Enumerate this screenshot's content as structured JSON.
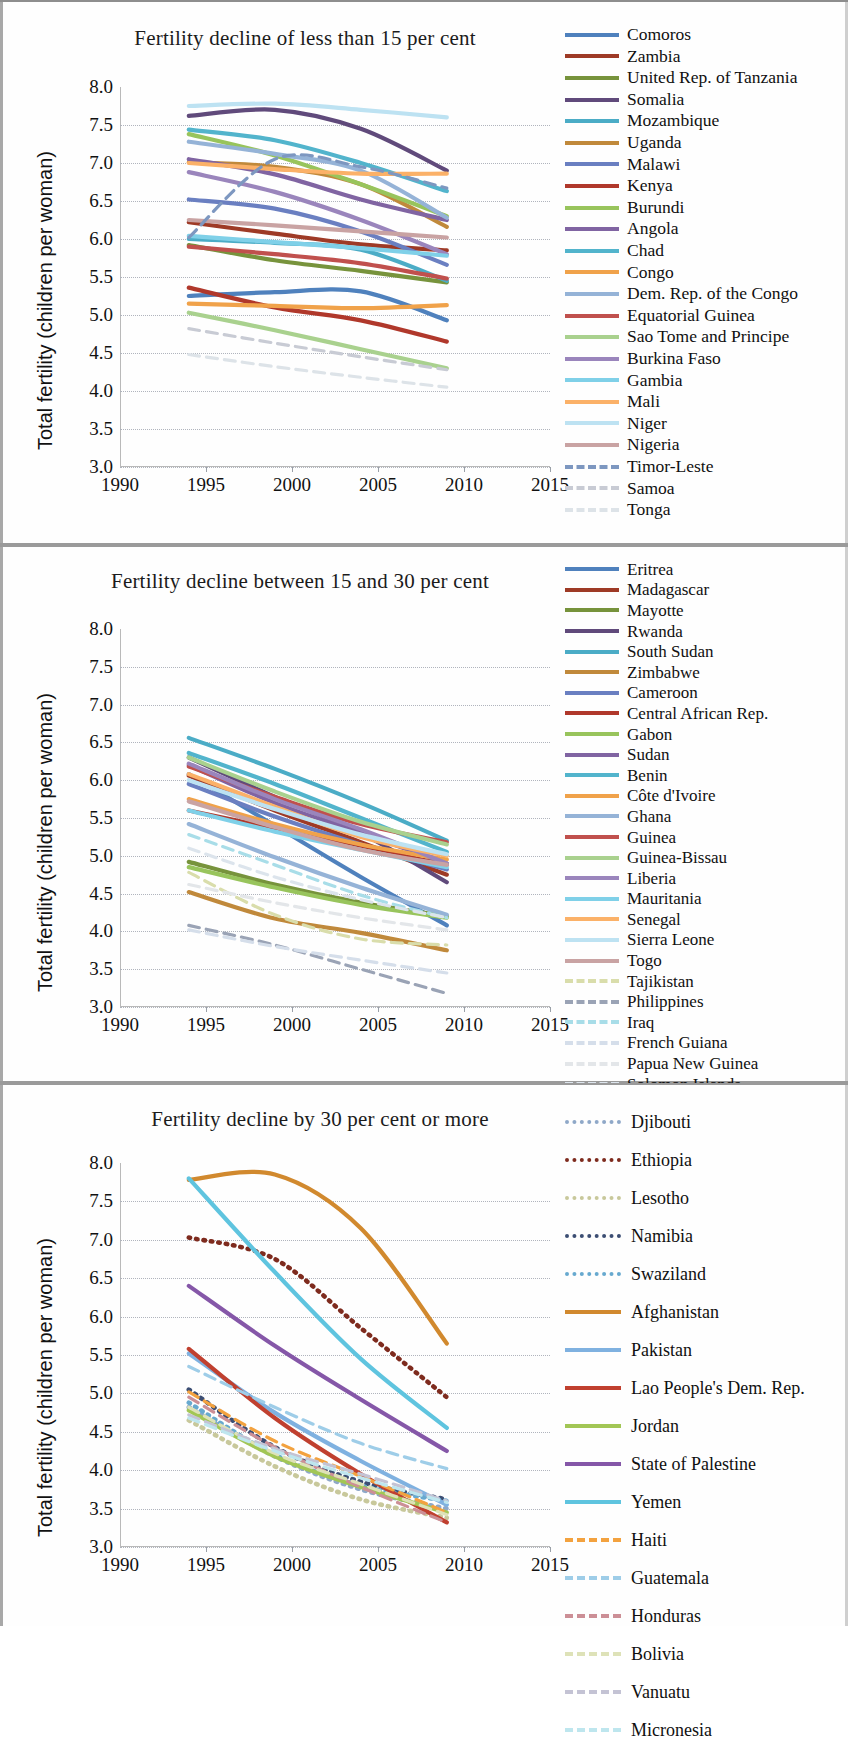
{
  "figure": {
    "ylabel": "Total fertility (children per woman)",
    "yticks": [
      "8.0",
      "7.5",
      "7.0",
      "6.5",
      "6.0",
      "5.5",
      "5.0",
      "4.5",
      "4.0",
      "3.5",
      "3.0"
    ],
    "xticks": [
      "1990",
      "1995",
      "2000",
      "2005",
      "2010",
      "2015"
    ]
  },
  "chart_data": [
    {
      "type": "line",
      "title": "Fertility decline of less than 15 per cent",
      "xlabel": "",
      "ylabel": "Total fertility (children per woman)",
      "xlim": [
        1990,
        2015
      ],
      "ylim": [
        3.0,
        8.0
      ],
      "x": [
        1994,
        1999,
        2004,
        2009
      ],
      "grid": true,
      "legend_position": "right",
      "series": [
        {
          "name": "Comoros",
          "color": "#4F81BD",
          "style": "solid",
          "values": [
            5.25,
            5.3,
            5.31,
            4.93
          ]
        },
        {
          "name": "Zambia",
          "color": "#9E3A26",
          "style": "solid",
          "values": [
            6.22,
            6.07,
            5.93,
            5.85
          ]
        },
        {
          "name": "United Rep. of Tanzania",
          "color": "#77933C",
          "style": "solid",
          "values": [
            5.92,
            5.72,
            5.58,
            5.43
          ]
        },
        {
          "name": "Somalia",
          "color": "#604A7B",
          "style": "solid",
          "values": [
            7.62,
            7.7,
            7.45,
            6.9
          ]
        },
        {
          "name": "Mozambique",
          "color": "#4BACC6",
          "style": "solid",
          "values": [
            6.0,
            5.95,
            5.86,
            5.45
          ]
        },
        {
          "name": "Uganda",
          "color": "#C0893B",
          "style": "solid",
          "values": [
            7.01,
            6.95,
            6.72,
            6.16
          ]
        },
        {
          "name": "Malawi",
          "color": "#6A7FC1",
          "style": "solid",
          "values": [
            6.52,
            6.4,
            6.1,
            5.66
          ]
        },
        {
          "name": "Kenya",
          "color": "#B0382B",
          "style": "solid",
          "values": [
            5.36,
            5.1,
            4.93,
            4.65
          ]
        },
        {
          "name": "Burundi",
          "color": "#98C45C",
          "style": "solid",
          "values": [
            7.38,
            7.1,
            6.72,
            6.3
          ]
        },
        {
          "name": "Angola",
          "color": "#8064A2",
          "style": "solid",
          "values": [
            7.05,
            6.85,
            6.52,
            6.25
          ]
        },
        {
          "name": "Chad",
          "color": "#52B4CC",
          "style": "solid",
          "values": [
            7.44,
            7.3,
            7.0,
            6.63
          ]
        },
        {
          "name": "Congo",
          "color": "#F0A24A",
          "style": "solid",
          "values": [
            5.15,
            5.12,
            5.09,
            5.13
          ]
        },
        {
          "name": "Dem. Rep. of the Congo",
          "color": "#95B3D7",
          "style": "solid",
          "values": [
            7.28,
            7.12,
            6.9,
            6.28
          ]
        },
        {
          "name": "Equatorial Guinea",
          "color": "#C0504D",
          "style": "solid",
          "values": [
            5.9,
            5.8,
            5.68,
            5.48
          ]
        },
        {
          "name": "Sao Tome and Principe",
          "color": "#A9D18E",
          "style": "solid",
          "values": [
            5.03,
            4.8,
            4.55,
            4.3
          ]
        },
        {
          "name": "Burkina Faso",
          "color": "#9A85BC",
          "style": "solid",
          "values": [
            6.88,
            6.62,
            6.25,
            5.8
          ]
        },
        {
          "name": "Gambia",
          "color": "#7FD0E8",
          "style": "solid",
          "values": [
            6.04,
            5.96,
            5.88,
            5.78
          ]
        },
        {
          "name": "Mali",
          "color": "#FBB168",
          "style": "solid",
          "values": [
            7.0,
            6.92,
            6.86,
            6.86
          ]
        },
        {
          "name": "Niger",
          "color": "#BDE2F2",
          "style": "solid",
          "values": [
            7.75,
            7.78,
            7.7,
            7.6
          ]
        },
        {
          "name": "Nigeria",
          "color": "#C9A3A3",
          "style": "solid",
          "values": [
            6.25,
            6.18,
            6.1,
            6.02
          ]
        },
        {
          "name": "Timor-Leste",
          "color": "#7D97C0",
          "style": "dashed",
          "values": [
            6.02,
            7.05,
            6.95,
            6.67
          ]
        },
        {
          "name": "Samoa",
          "color": "#C8CBD4",
          "style": "dashed",
          "values": [
            4.82,
            4.63,
            4.45,
            4.28
          ]
        },
        {
          "name": "Tonga",
          "color": "#DDE3E8",
          "style": "dashed",
          "values": [
            4.48,
            4.32,
            4.18,
            4.05
          ]
        }
      ]
    },
    {
      "type": "line",
      "title": "Fertility decline between 15 and 30 per cent",
      "xlabel": "",
      "ylabel": "Total fertility (children per woman)",
      "xlim": [
        1990,
        2015
      ],
      "ylim": [
        3.0,
        8.0
      ],
      "x": [
        1994,
        1999,
        2004,
        2009
      ],
      "grid": true,
      "legend_position": "right",
      "series": [
        {
          "name": "Eritrea",
          "color": "#4F81BD",
          "style": "solid",
          "values": [
            6.08,
            5.4,
            4.72,
            4.08
          ]
        },
        {
          "name": "Madagascar",
          "color": "#9E3A26",
          "style": "solid",
          "values": [
            6.06,
            5.6,
            5.18,
            4.75
          ]
        },
        {
          "name": "Mayotte",
          "color": "#77933C",
          "style": "solid",
          "values": [
            4.92,
            4.62,
            4.38,
            4.2
          ]
        },
        {
          "name": "Rwanda",
          "color": "#604A7B",
          "style": "solid",
          "values": [
            6.3,
            5.78,
            5.3,
            4.65
          ]
        },
        {
          "name": "South Sudan",
          "color": "#4BACC6",
          "style": "solid",
          "values": [
            6.56,
            6.15,
            5.7,
            5.2
          ]
        },
        {
          "name": "Zimbabwe",
          "color": "#C0893B",
          "style": "solid",
          "values": [
            4.52,
            4.17,
            3.98,
            3.75
          ]
        },
        {
          "name": "Cameroon",
          "color": "#6A7FC1",
          "style": "solid",
          "values": [
            5.95,
            5.52,
            5.15,
            4.82
          ]
        },
        {
          "name": "Central African Rep.",
          "color": "#B0382B",
          "style": "solid",
          "values": [
            5.6,
            5.36,
            5.12,
            4.88
          ]
        },
        {
          "name": "Gabon",
          "color": "#98C45C",
          "style": "solid",
          "values": [
            4.85,
            4.58,
            4.35,
            4.18
          ]
        },
        {
          "name": "Sudan",
          "color": "#8064A2",
          "style": "solid",
          "values": [
            6.2,
            5.7,
            5.3,
            4.9
          ]
        },
        {
          "name": "Benin",
          "color": "#52B4CC",
          "style": "solid",
          "values": [
            6.36,
            5.95,
            5.5,
            5.05
          ]
        },
        {
          "name": "Côte d'Ivoire",
          "color": "#F0A24A",
          "style": "solid",
          "values": [
            5.75,
            5.42,
            5.15,
            4.95
          ]
        },
        {
          "name": "Ghana",
          "color": "#95B3D7",
          "style": "solid",
          "values": [
            5.42,
            4.98,
            4.58,
            4.22
          ]
        },
        {
          "name": "Guinea",
          "color": "#C0504D",
          "style": "solid",
          "values": [
            6.18,
            5.78,
            5.42,
            5.18
          ]
        },
        {
          "name": "Guinea-Bissau",
          "color": "#A9D18E",
          "style": "solid",
          "values": [
            6.3,
            5.85,
            5.45,
            5.15
          ]
        },
        {
          "name": "Liberia",
          "color": "#9A85BC",
          "style": "solid",
          "values": [
            6.22,
            5.75,
            5.35,
            4.9
          ]
        },
        {
          "name": "Mauritania",
          "color": "#7FD0E8",
          "style": "solid",
          "values": [
            5.6,
            5.32,
            5.08,
            4.85
          ]
        },
        {
          "name": "Senegal",
          "color": "#FBB168",
          "style": "solid",
          "values": [
            6.08,
            5.65,
            5.25,
            5.0
          ]
        },
        {
          "name": "Sierra Leone",
          "color": "#BDE2F2",
          "style": "solid",
          "values": [
            6.0,
            5.62,
            5.28,
            5.02
          ]
        },
        {
          "name": "Togo",
          "color": "#C9A3A3",
          "style": "solid",
          "values": [
            5.72,
            5.38,
            5.08,
            4.88
          ]
        },
        {
          "name": "Tajikistan",
          "color": "#D9DDAB",
          "style": "dashed",
          "values": [
            4.78,
            4.22,
            3.9,
            3.82
          ]
        },
        {
          "name": "Philippines",
          "color": "#9AA3B5",
          "style": "dashed",
          "values": [
            4.08,
            3.82,
            3.5,
            3.18
          ]
        },
        {
          "name": "Iraq",
          "color": "#A8DDE8",
          "style": "dashed",
          "values": [
            5.28,
            4.88,
            4.48,
            4.18
          ]
        },
        {
          "name": "French Guiana",
          "color": "#D5DEEA",
          "style": "dashed",
          "values": [
            4.02,
            3.8,
            3.62,
            3.45
          ]
        },
        {
          "name": "Papua New Guinea",
          "color": "#E3E6E9",
          "style": "dashed",
          "values": [
            4.62,
            4.38,
            4.18,
            4.02
          ]
        },
        {
          "name": "Solomon Islands",
          "color": "#DCE4EC",
          "style": "dashed",
          "values": [
            5.1,
            4.72,
            4.42,
            4.18
          ]
        }
      ]
    },
    {
      "type": "line",
      "title": "Fertility decline by 30 per cent or more",
      "xlabel": "",
      "ylabel": "Total fertility (children per woman)",
      "xlim": [
        1990,
        2015
      ],
      "ylim": [
        3.0,
        8.0
      ],
      "x": [
        1994,
        1999,
        2004,
        2009
      ],
      "grid": true,
      "legend_position": "right",
      "series": [
        {
          "name": "Djibouti",
          "color": "#8FA8C8",
          "style": "dotted",
          "values": [
            4.82,
            4.18,
            3.75,
            3.5
          ]
        },
        {
          "name": "Ethiopia",
          "color": "#7E2B1E",
          "style": "dotted",
          "values": [
            7.03,
            6.75,
            5.85,
            4.95
          ]
        },
        {
          "name": "Lesotho",
          "color": "#C8C89B",
          "style": "dotted",
          "values": [
            4.65,
            4.05,
            3.62,
            3.38
          ]
        },
        {
          "name": "Namibia",
          "color": "#3C4E73",
          "style": "dotted",
          "values": [
            5.05,
            4.3,
            3.85,
            3.62
          ]
        },
        {
          "name": "Swaziland",
          "color": "#67A9CF",
          "style": "dotted",
          "values": [
            4.88,
            4.2,
            3.8,
            3.6
          ]
        },
        {
          "name": "Afghanistan",
          "color": "#D1892E",
          "style": "solid",
          "values": [
            7.78,
            7.85,
            7.15,
            5.65
          ]
        },
        {
          "name": "Pakistan",
          "color": "#7FB1E0",
          "style": "solid",
          "values": [
            5.52,
            4.75,
            4.12,
            3.55
          ]
        },
        {
          "name": "Lao People's Dem. Rep.",
          "color": "#C0402F",
          "style": "solid",
          "values": [
            5.58,
            4.68,
            3.95,
            3.32
          ]
        },
        {
          "name": "Jordan",
          "color": "#A2C655",
          "style": "solid",
          "values": [
            4.78,
            4.18,
            3.78,
            3.45
          ]
        },
        {
          "name": "State of Palestine",
          "color": "#8557A8",
          "style": "solid",
          "values": [
            6.4,
            5.62,
            4.92,
            4.25
          ]
        },
        {
          "name": "Yemen",
          "color": "#5FC4DF",
          "style": "solid",
          "values": [
            7.8,
            6.58,
            5.45,
            4.55
          ]
        },
        {
          "name": "Haiti",
          "color": "#F3A23F",
          "style": "dashed",
          "values": [
            5.02,
            4.38,
            3.92,
            3.45
          ]
        },
        {
          "name": "Guatemala",
          "color": "#9ECDE8",
          "style": "dashed",
          "values": [
            5.35,
            4.82,
            4.35,
            4.02
          ]
        },
        {
          "name": "Honduras",
          "color": "#CC8F96",
          "style": "dashed",
          "values": [
            4.95,
            4.3,
            3.78,
            3.32
          ]
        },
        {
          "name": "Bolivia",
          "color": "#DEE2B8",
          "style": "dashed",
          "values": [
            4.82,
            4.22,
            3.82,
            3.42
          ]
        },
        {
          "name": "Vanuatu",
          "color": "#C4C3D4",
          "style": "dashed",
          "values": [
            4.72,
            4.28,
            3.95,
            3.6
          ]
        },
        {
          "name": "Micronesia",
          "color": "#BEE6EE",
          "style": "dashed",
          "values": [
            4.68,
            4.25,
            3.9,
            3.58
          ]
        }
      ]
    }
  ]
}
